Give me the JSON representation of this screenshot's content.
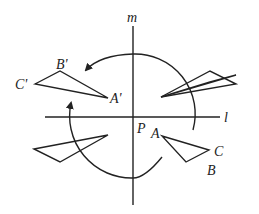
{
  "diagram": {
    "axes": {
      "vertical_label": "m",
      "horizontal_label": "l",
      "center_label": "P"
    },
    "original_triangle": {
      "A": "A",
      "B": "B",
      "C": "C"
    },
    "image_triangle": {
      "A": "A'",
      "B": "B'",
      "C": "C'"
    },
    "colors": {
      "stroke": "#222222",
      "background": "#ffffff"
    }
  }
}
